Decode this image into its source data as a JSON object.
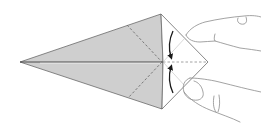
{
  "diagram": {
    "title": "Origami kite base: squash-fold flap closed",
    "colors": {
      "paper_colored": "#cfcfcf",
      "paper_white": "#ffffff",
      "outline": "#6a6a6a",
      "center_line": "#4a4a4a",
      "dashed_fold": "#6e6e6e",
      "crease": "#c8c8c8",
      "arrow": "#1a1a1a",
      "hand": "#8c8c8c"
    },
    "shapes": {
      "kite_gray": {
        "points": [
          [
            20,
            62
          ],
          [
            161,
            14
          ],
          [
            163,
            62
          ],
          [
            162,
            109
          ]
        ]
      },
      "diamond_white": {
        "points": [
          [
            161,
            14
          ],
          [
            208,
            62
          ],
          [
            162,
            109
          ],
          [
            163,
            62
          ]
        ]
      },
      "center_line": {
        "from": [
          20,
          62
        ],
        "to": [
          163,
          62
        ]
      },
      "valley_fold_upper": {
        "from": [
          127,
          25
        ],
        "to": [
          162,
          62
        ]
      },
      "valley_fold_lower": {
        "from": [
          162,
          62
        ],
        "to": [
          128,
          98
        ]
      },
      "valley_fold_horizontal": {
        "from": [
          163,
          62
        ],
        "to": [
          208,
          62
        ]
      },
      "crease_upper": {
        "from": [
          163,
          62
        ],
        "to": [
          185,
          38
        ]
      },
      "crease_lower": {
        "from": [
          163,
          62
        ],
        "to": [
          185,
          86
        ]
      }
    },
    "arrows": [
      {
        "name": "fold-down-arrow",
        "direction": "down",
        "from": [
          173,
          32
        ],
        "to": [
          171,
          58
        ]
      },
      {
        "name": "fold-up-arrow",
        "direction": "up",
        "from": [
          173,
          92
        ],
        "to": [
          171,
          66
        ]
      }
    ],
    "hands": [
      "upper-finger",
      "lower-thumb"
    ]
  }
}
